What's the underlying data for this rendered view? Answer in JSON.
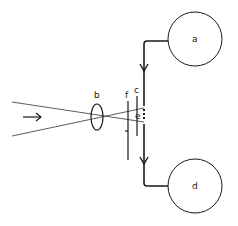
{
  "diagram": {
    "type": "optical-schematic",
    "labels": {
      "a": "a",
      "b": "b",
      "c": "c",
      "d": "d",
      "e": "e",
      "f": "f"
    },
    "icons": {
      "incoming_arrow": "right-arrow",
      "flow_arrow_top": "down-arrow",
      "flow_arrow_bottom": "down-arrow"
    },
    "colors": {
      "stroke": "#1a1a1a",
      "background": "#ffffff"
    }
  }
}
